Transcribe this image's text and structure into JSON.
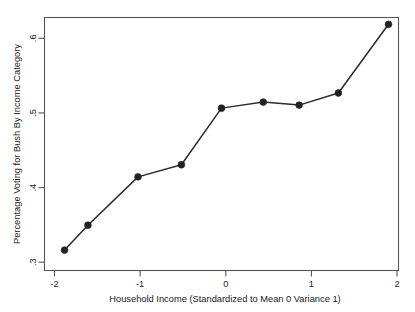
{
  "chart_data": {
    "type": "line",
    "title": "",
    "xlabel": "Household Income (Standardized to Mean 0 Variance 1)",
    "ylabel": "Percentage Voting for Bush By Income Category",
    "xlim": [
      -2.12,
      2.12
    ],
    "ylim": [
      0.293,
      0.628
    ],
    "xticks": [
      -2,
      -1,
      0,
      1,
      2
    ],
    "xtick_labels": [
      "-2",
      "-1",
      "0",
      "1",
      "2"
    ],
    "yticks": [
      0.3,
      0.4,
      0.5,
      0.6
    ],
    "ytick_labels": [
      ".3",
      ".4",
      ".5",
      ".6"
    ],
    "grid": false,
    "legend": null,
    "marker": "filled-circle",
    "line_color": "#2b2b2b",
    "marker_color": "#222222",
    "x": [
      -1.88,
      -1.6,
      -1.0,
      -0.48,
      0.0,
      0.5,
      0.93,
      1.4,
      2.0
    ],
    "values": [
      0.32,
      0.353,
      0.417,
      0.433,
      0.508,
      0.516,
      0.512,
      0.528,
      0.619
    ],
    "series": [
      {
        "name": "Percentage Voting for Bush By Income Category",
        "points": [
          {
            "x": -1.88,
            "y": 0.32
          },
          {
            "x": -1.6,
            "y": 0.353
          },
          {
            "x": -1.0,
            "y": 0.417
          },
          {
            "x": -0.48,
            "y": 0.433
          },
          {
            "x": 0.0,
            "y": 0.508
          },
          {
            "x": 0.5,
            "y": 0.516
          },
          {
            "x": 0.93,
            "y": 0.512
          },
          {
            "x": 1.4,
            "y": 0.528
          },
          {
            "x": 2.0,
            "y": 0.619
          }
        ]
      }
    ]
  },
  "axes": {
    "x_axis_title": "Household Income (Standardized to Mean 0 Variance 1)",
    "y_axis_title": "Percentage Voting for Bush By Income Category",
    "x_tick_0": "-2",
    "x_tick_1": "-1",
    "x_tick_2": "0",
    "x_tick_3": "1",
    "x_tick_4": "2",
    "y_tick_0": ".3",
    "y_tick_1": ".4",
    "y_tick_2": ".5",
    "y_tick_3": ".6"
  }
}
